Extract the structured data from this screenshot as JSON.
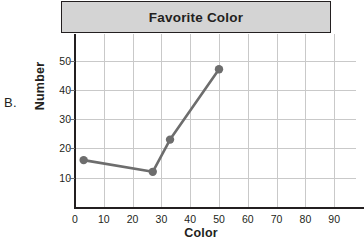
{
  "item_label": "B.",
  "chart_data": {
    "type": "line",
    "title": "Favorite Color",
    "xlabel": "Color",
    "ylabel": "Number",
    "xlim": [
      0,
      98
    ],
    "ylim": [
      0,
      58
    ],
    "grid": true,
    "legend": false,
    "x_ticks": [
      "0",
      "10",
      "20",
      "30",
      "40",
      "50",
      "60",
      "70",
      "80",
      "90"
    ],
    "x_tick_values": [
      0,
      10,
      20,
      30,
      40,
      50,
      60,
      70,
      80,
      90
    ],
    "y_ticks": [
      "10",
      "20",
      "30",
      "40",
      "50"
    ],
    "y_tick_values": [
      10,
      20,
      30,
      40,
      50
    ],
    "series": [
      {
        "name": "Favorite Color",
        "color": "#6d6d6d",
        "marker": "circle",
        "x": [
          3,
          27,
          33,
          50
        ],
        "y": [
          16,
          12,
          23,
          47
        ]
      }
    ]
  },
  "colors": {
    "title_band": "#d4d4d4",
    "axis": "#231f20",
    "grid": "#c9c9c9",
    "series": "#6d6d6d",
    "text": "#231f20"
  }
}
